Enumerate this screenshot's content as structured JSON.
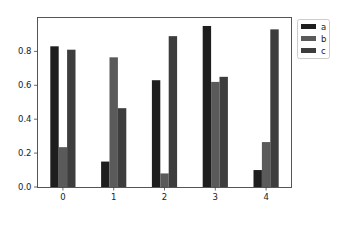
{
  "chart_data": {
    "type": "bar",
    "title": "",
    "xlabel": "",
    "ylabel": "",
    "categories": [
      "0",
      "1",
      "2",
      "3",
      "4"
    ],
    "series": [
      {
        "name": "a",
        "color": "#1e1e1e",
        "values": [
          0.83,
          0.15,
          0.63,
          0.95,
          0.1
        ]
      },
      {
        "name": "b",
        "color": "#5a5a5a",
        "values": [
          0.235,
          0.765,
          0.08,
          0.62,
          0.265
        ]
      },
      {
        "name": "c",
        "color": "#3d3d3d",
        "values": [
          0.81,
          0.465,
          0.89,
          0.65,
          0.93
        ]
      }
    ],
    "ylim": [
      0,
      1.0
    ],
    "yticks": [
      "0.0",
      "0.2",
      "0.4",
      "0.6",
      "0.8"
    ],
    "ytick_values": [
      0.0,
      0.2,
      0.4,
      0.6,
      0.8
    ],
    "grid": false,
    "legend": {
      "position": "outside upper right",
      "entries": [
        "a",
        "b",
        "c"
      ]
    }
  }
}
